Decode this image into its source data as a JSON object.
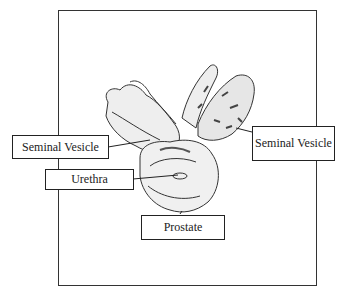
{
  "diagram": {
    "labels": {
      "seminal_vesicle_left": "Seminal Vesicle",
      "urethra": "Urethra",
      "seminal_vesicle_right": "Seminal Vesicle",
      "prostate": "Prostate"
    },
    "colors": {
      "line": "#222222",
      "background": "#ffffff"
    }
  }
}
